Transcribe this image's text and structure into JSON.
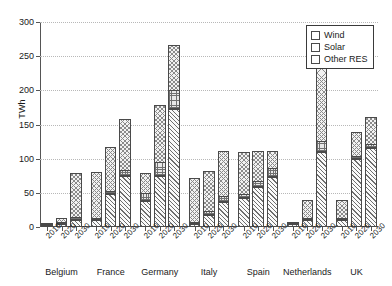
{
  "chart_data": {
    "type": "bar",
    "subtype": "stacked-bar-grouped",
    "title": "",
    "subtitle": "",
    "xlabel": "",
    "ylabel": "TWh",
    "ylim": [
      0,
      300
    ],
    "yticks": [
      0,
      50,
      100,
      150,
      200,
      250,
      300
    ],
    "ytick_labels": [
      "0",
      "50",
      "100",
      "150",
      "200",
      "250",
      "300"
    ],
    "grid": true,
    "grid_axis": "y",
    "legend": {
      "position": "top-right",
      "entries": [
        {
          "label": "Wind",
          "pattern": "diagonal-hatch",
          "color": "#fafafa"
        },
        {
          "label": "Solar",
          "pattern": "cross-grid-hatch",
          "color": "#e8e8e8"
        },
        {
          "label": "Other RES",
          "pattern": "cross-diagonal-hatch",
          "color": "#f2f2f2"
        }
      ]
    },
    "groups": [
      "Belgium",
      "France",
      "Germany",
      "Italy",
      "Spain",
      "Netherlands",
      "UK"
    ],
    "categories": [
      "2010",
      "2020",
      "2030",
      "2010",
      "2020",
      "2030",
      "2010",
      "2020",
      "2030",
      "2010",
      "2020",
      "2030",
      "2010",
      "2020",
      "2030",
      "2010",
      "2020",
      "2030",
      "2010",
      "2020",
      "2030"
    ],
    "series": [
      {
        "name": "Wind",
        "values": [
          1,
          5,
          10,
          10,
          48,
          75,
          38,
          75,
          172,
          5,
          18,
          36,
          43,
          58,
          73,
          4,
          10,
          110,
          10,
          100,
          115
        ]
      },
      {
        "name": "Solar",
        "values": [
          0,
          2,
          5,
          1,
          5,
          9,
          12,
          20,
          28,
          2,
          6,
          10,
          6,
          10,
          14,
          0,
          1,
          16,
          2,
          4,
          7
        ]
      },
      {
        "name": "Other RES",
        "values": [
          2,
          7,
          65,
          69,
          65,
          76,
          30,
          85,
          68,
          65,
          60,
          67,
          62,
          44,
          25,
          1,
          28,
          167,
          28,
          37,
          40
        ]
      }
    ],
    "totals": [
      3,
      14,
      80,
      80,
      118,
      160,
      80,
      180,
      268,
      72,
      84,
      113,
      111,
      112,
      112,
      5,
      39,
      293,
      40,
      141,
      162
    ]
  }
}
